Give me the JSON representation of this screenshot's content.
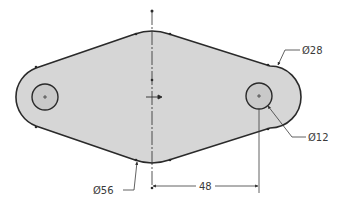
{
  "drawing": {
    "type": "2D engineering sketch",
    "colors": {
      "fill": "#d6d6d6",
      "hole_fill": "#c9c9c9",
      "outline": "#2a2a2a",
      "dimension": "#3a3a3a",
      "background": "#ffffff"
    },
    "dimensions": {
      "outer_radius_callout": "Ø28",
      "hole_callout": "Ø12",
      "center_arc_callout": "Ø56",
      "center_distance": "48"
    }
  }
}
